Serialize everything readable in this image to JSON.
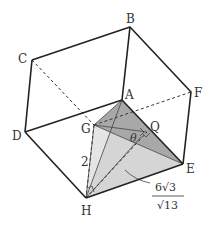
{
  "diagram": {
    "type": "cube-with-tetrahedron",
    "vertices": {
      "A": {
        "label": "A",
        "x": 122,
        "y": 100
      },
      "B": {
        "label": "B",
        "x": 130,
        "y": 27
      },
      "C": {
        "label": "C",
        "x": 32,
        "y": 60
      },
      "D": {
        "label": "D",
        "x": 25,
        "y": 132
      },
      "E": {
        "label": "E",
        "x": 183,
        "y": 164
      },
      "F": {
        "label": "F",
        "x": 191,
        "y": 92
      },
      "G": {
        "label": "G",
        "x": 94,
        "y": 125
      },
      "H": {
        "label": "H",
        "x": 86,
        "y": 198
      },
      "Q": {
        "label": "Q",
        "x": 147,
        "y": 132
      }
    },
    "annotations": {
      "angle_label": "θ",
      "edge_GH_length": "2",
      "fraction_numerator": "6√3",
      "fraction_denominator": "√13"
    },
    "colors": {
      "edge": "#222222",
      "shade_light": "#d9d9d9",
      "shade_dark": "#a9a9a9",
      "text": "#333333"
    }
  }
}
